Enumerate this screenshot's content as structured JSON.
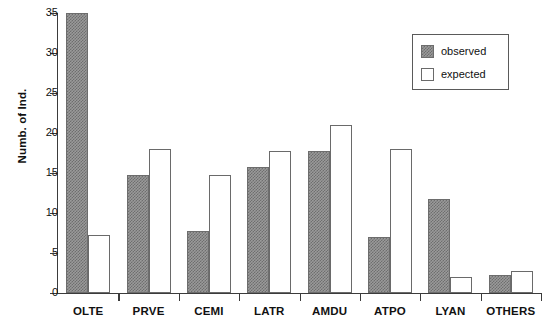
{
  "chart_data": {
    "type": "bar",
    "title": "",
    "xlabel": "",
    "ylabel": "Numb. of Ind.",
    "ylim": [
      0,
      35
    ],
    "yticks": [
      0,
      5,
      10,
      15,
      20,
      25,
      30,
      35
    ],
    "ytick_labels": [
      "0",
      "5",
      "10",
      "15",
      "20",
      "25",
      "30",
      "35"
    ],
    "grid": false,
    "legend_position": "top-right",
    "categories": [
      "OLTE",
      "PRVE",
      "CEMI",
      "LATR",
      "AMDU",
      "ATPO",
      "LYAN",
      "OTHERS"
    ],
    "series": [
      {
        "name": "observed",
        "fill": "checkerboard-gray",
        "color": "#9a9a9a",
        "values": [
          35,
          14.7,
          7.8,
          15.7,
          17.8,
          7,
          11.8,
          2.2
        ]
      },
      {
        "name": "expected",
        "fill": "white-outline",
        "color": "#ffffff",
        "values": [
          7.2,
          18,
          14.8,
          17.7,
          21,
          18,
          2,
          2.8
        ]
      }
    ]
  },
  "legend": {
    "entries": [
      {
        "label": "observed"
      },
      {
        "label": "expected"
      }
    ]
  },
  "axes": {
    "axis_color": "#3b3b3b",
    "text_color": "#111111"
  }
}
